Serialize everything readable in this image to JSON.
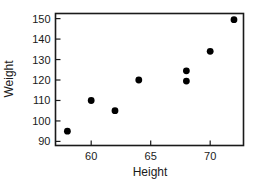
{
  "chart_data": {
    "type": "scatter",
    "title": "",
    "xlabel": "Height",
    "ylabel": "Weight",
    "xlim": [
      57,
      72.8
    ],
    "ylim": [
      88,
      152.5
    ],
    "grid": false,
    "legend": null,
    "xticks": [
      60,
      65,
      70
    ],
    "yticks": [
      90,
      100,
      110,
      120,
      130,
      140,
      150
    ],
    "xtick_labels": [
      "60",
      "65",
      "70"
    ],
    "ytick_labels": [
      "90",
      "100",
      "110",
      "120",
      "130",
      "140",
      "150"
    ],
    "series": [
      {
        "name": "height-weight",
        "marker": "filled-circle",
        "color": "#000000",
        "points": [
          {
            "x": 58,
            "y": 95
          },
          {
            "x": 60,
            "y": 110
          },
          {
            "x": 62,
            "y": 105
          },
          {
            "x": 64,
            "y": 120
          },
          {
            "x": 68,
            "y": 124.5
          },
          {
            "x": 68,
            "y": 119.5
          },
          {
            "x": 70,
            "y": 134
          },
          {
            "x": 72,
            "y": 149.5
          }
        ]
      }
    ]
  },
  "axes": {
    "x_axis_title": "Height",
    "y_axis_title": "Weight"
  }
}
